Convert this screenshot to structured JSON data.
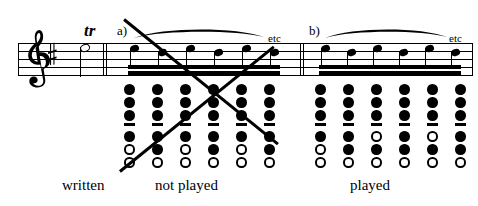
{
  "figure": {
    "ink_color": "#000000",
    "background_color": "#ffffff"
  },
  "music": {
    "clef": "treble-clef",
    "key_signature": "one-sharp",
    "trill_marking": "tr",
    "written_note": "half-note"
  },
  "sections": {
    "a": {
      "label": "a)",
      "etc_label": "etc",
      "verdict": "not played",
      "note_count": 6,
      "beam": "sixteenth-double-beam",
      "slur": true,
      "crossed_out": true,
      "fingerings": [
        {
          "holes": [
            "closed",
            "closed",
            "closed",
            "bar",
            "closed",
            "open",
            "open"
          ]
        },
        {
          "holes": [
            "closed",
            "closed",
            "closed",
            "bar",
            "closed",
            "closed",
            "open"
          ]
        },
        {
          "holes": [
            "closed",
            "closed",
            "closed",
            "bar",
            "closed",
            "open",
            "open"
          ]
        },
        {
          "holes": [
            "closed",
            "closed",
            "closed",
            "bar",
            "closed",
            "closed",
            "open"
          ]
        },
        {
          "holes": [
            "closed",
            "closed",
            "closed",
            "bar",
            "closed",
            "open",
            "open"
          ]
        },
        {
          "holes": [
            "closed",
            "closed",
            "closed",
            "bar",
            "closed",
            "closed",
            "open"
          ]
        }
      ]
    },
    "b": {
      "label": "b)",
      "etc_label": "etc",
      "verdict": "played",
      "note_count": 6,
      "beam": "sixteenth-double-beam",
      "slur": true,
      "crossed_out": false,
      "fingerings": [
        {
          "holes": [
            "closed",
            "closed",
            "closed",
            "bar",
            "closed",
            "open",
            "open"
          ]
        },
        {
          "holes": [
            "closed",
            "closed",
            "closed",
            "bar",
            "closed",
            "closed",
            "open"
          ]
        },
        {
          "holes": [
            "closed",
            "closed",
            "closed",
            "bar",
            "open",
            "closed",
            "open"
          ]
        },
        {
          "holes": [
            "closed",
            "closed",
            "closed",
            "bar",
            "closed",
            "closed",
            "open"
          ]
        },
        {
          "holes": [
            "closed",
            "closed",
            "closed",
            "bar",
            "open",
            "closed",
            "open"
          ]
        },
        {
          "holes": [
            "closed",
            "closed",
            "closed",
            "bar",
            "closed",
            "closed",
            "open"
          ]
        }
      ]
    }
  },
  "captions": {
    "written": "written",
    "not_played": "not  played",
    "played": "played"
  }
}
